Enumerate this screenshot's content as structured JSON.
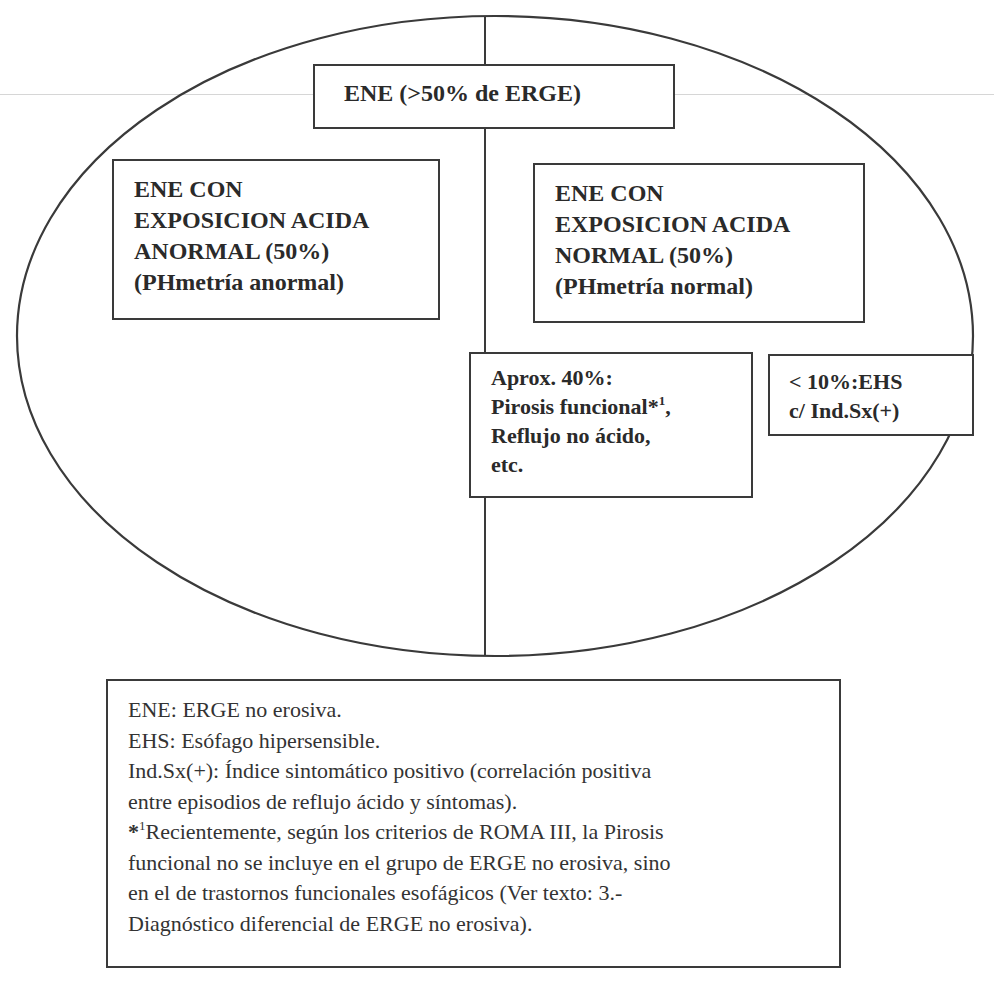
{
  "diagram": {
    "type": "ellipse-split-classification",
    "colors": {
      "stroke": "#3a3a3a",
      "text": "#2a2a2a",
      "background": "#ffffff"
    },
    "top_box": {
      "label": "ENE (>50% de ERGE)"
    },
    "left_box": {
      "lines": [
        "ENE CON",
        "EXPOSICION ACIDA",
        "ANORMAL (50%)",
        "(PHmetría anormal)"
      ]
    },
    "right_box": {
      "lines": [
        "ENE CON",
        "EXPOSICION ACIDA",
        "NORMAL (50%)",
        "(PHmetría normal)"
      ]
    },
    "aprox_box": {
      "line1": "Aprox. 40%:",
      "line2_text": "Pirosis  funcional*",
      "line2_sup": "1",
      "line2_tail": ",",
      "line3": "Reflujo no ácido,",
      "line4": "etc."
    },
    "ehs_box": {
      "line1": "< 10%:EHS",
      "line2": "c/ Ind.Sx(+)"
    }
  },
  "legend": {
    "lines": [
      "ENE: ERGE no erosiva.",
      "EHS: Esófago hipersensible.",
      "Ind.Sx(+): Índice sintomático positivo (correlación positiva",
      "entre episodios de reflujo ácido y síntomas)."
    ],
    "footnote_marker": "*",
    "footnote_sup": "1",
    "footnote_lines": [
      "Recientemente, según los criterios de ROMA III, la Pirosis",
      "funcional no se incluye en el grupo de ERGE no erosiva, sino",
      "en el de trastornos funcionales esofágicos (Ver texto: 3.-",
      "Diagnóstico diferencial de ERGE no erosiva)."
    ]
  }
}
